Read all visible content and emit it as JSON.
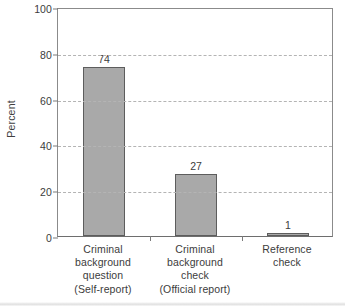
{
  "chart_data": {
    "type": "bar",
    "title": "",
    "xlabel": "",
    "ylabel": "Percent",
    "ylim": [
      0,
      100
    ],
    "yticks": [
      0,
      20,
      40,
      60,
      80,
      100
    ],
    "ytick_labels": [
      "0",
      "20",
      "40",
      "60",
      "80",
      "100"
    ],
    "grid": "horizontal-dashed",
    "gridline_values": [
      20,
      40,
      60,
      80
    ],
    "legend": "none",
    "bar_color": "#a9a9a9",
    "bar_edge_color": "#5d5d5d",
    "categories": [
      "Criminal background question (Self-report)",
      "Criminal background check (Official report)",
      "Reference check"
    ],
    "category_label_lines": [
      [
        "Criminal",
        "background",
        "question",
        "(Self-report)"
      ],
      [
        "Criminal",
        "background",
        "check",
        "(Official report)"
      ],
      [
        "Reference",
        "check"
      ]
    ],
    "values": [
      74,
      27,
      1
    ],
    "value_labels": [
      "74",
      "27",
      "1"
    ]
  }
}
